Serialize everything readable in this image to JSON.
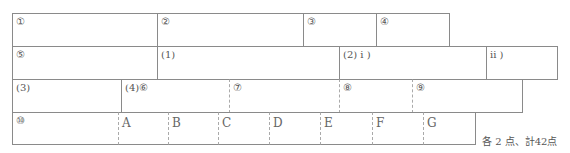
{
  "answer_sheet": {
    "rows": [
      {
        "cells": [
          {
            "label": "①"
          },
          {
            "label": "②"
          },
          {
            "label": "③"
          },
          {
            "label": "④"
          }
        ]
      },
      {
        "cells": [
          {
            "label": "⑤"
          },
          {
            "label": "(1)"
          },
          {
            "label": "(2) i )"
          },
          {
            "label": "ii )"
          }
        ]
      },
      {
        "cells": [
          {
            "label": "(3)"
          },
          {
            "label": "(4)⑥"
          },
          {
            "label": "⑦"
          },
          {
            "label": "⑧"
          },
          {
            "label": "⑨"
          }
        ]
      },
      {
        "cells": [
          {
            "label": "⑩"
          },
          {
            "label": "A"
          },
          {
            "label": "B"
          },
          {
            "label": "C"
          },
          {
            "label": "D"
          },
          {
            "label": "E"
          },
          {
            "label": "F"
          },
          {
            "label": "G"
          }
        ]
      }
    ],
    "score_note": "各 2 点、計42点"
  }
}
